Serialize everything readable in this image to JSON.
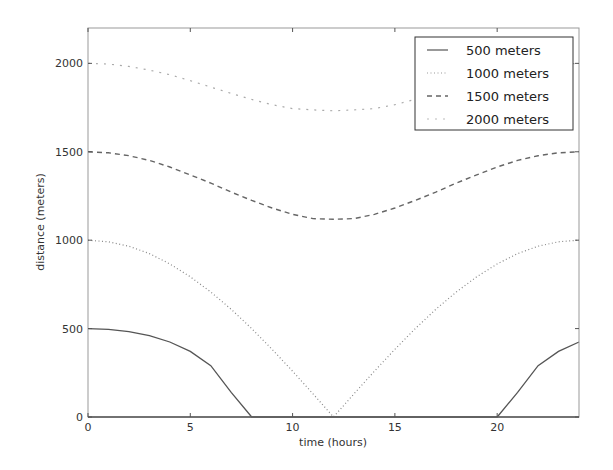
{
  "chart_data": {
    "type": "line",
    "title": "",
    "xlabel": "time (hours)",
    "ylabel": "distance (meters)",
    "xlim": [
      0,
      24
    ],
    "ylim": [
      0,
      2200
    ],
    "xticks": [
      0,
      5,
      10,
      15,
      20
    ],
    "yticks": [
      0,
      500,
      1000,
      1500,
      2000
    ],
    "grid": false,
    "legend_position": "upper right",
    "x": [
      0,
      1,
      2,
      3,
      4,
      5,
      6,
      7,
      8,
      9,
      10,
      11,
      12,
      13,
      14,
      15,
      16,
      17,
      18,
      19,
      20,
      21,
      22,
      23,
      24
    ],
    "series": [
      {
        "name": "500 meters",
        "style": "solid",
        "color": "#555555",
        "values": [
          500,
          496,
          483,
          460,
          424,
          371,
          290,
          139,
          0,
          0,
          0,
          0,
          0,
          0,
          0,
          0,
          0,
          0,
          0,
          0,
          0,
          139,
          290,
          371,
          424
        ]
      },
      {
        "name": "1000 meters",
        "style": "dotted",
        "color": "#888888",
        "values": [
          1000,
          991,
          966,
          924,
          866,
          793,
          707,
          609,
          500,
          383,
          259,
          131,
          0,
          131,
          259,
          383,
          500,
          609,
          707,
          793,
          866,
          924,
          966,
          991,
          1000
        ]
      },
      {
        "name": "1500 meters",
        "style": "dashed",
        "color": "#666666",
        "values": [
          1500,
          1494,
          1478,
          1451,
          1414,
          1369,
          1323,
          1272,
          1225,
          1182,
          1146,
          1122,
          1118,
          1122,
          1146,
          1182,
          1225,
          1272,
          1323,
          1369,
          1414,
          1451,
          1478,
          1494,
          1500
        ]
      },
      {
        "name": "2000 meters",
        "style": "dashdot",
        "color": "#aaaaaa",
        "values": [
          2000,
          1996,
          1983,
          1962,
          1936,
          1902,
          1866,
          1830,
          1796,
          1766,
          1744,
          1737,
          1732,
          1737,
          1744,
          1766,
          1796,
          1830,
          1866,
          1902,
          1936,
          1962,
          1983,
          1996,
          2000
        ]
      }
    ]
  },
  "legend": {
    "items": [
      {
        "label": "500 meters"
      },
      {
        "label": "1000 meters"
      },
      {
        "label": "1500 meters"
      },
      {
        "label": "2000 meters"
      }
    ]
  },
  "axes": {
    "xlabel": "time (hours)",
    "ylabel": "distance (meters)",
    "xtick_labels": [
      "0",
      "5",
      "10",
      "15",
      "20"
    ],
    "ytick_labels": [
      "0",
      "500",
      "1000",
      "1500",
      "2000"
    ]
  }
}
